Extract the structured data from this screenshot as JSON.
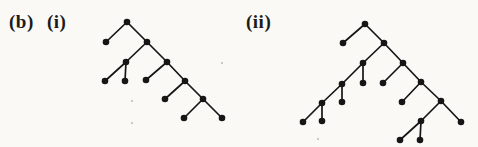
{
  "page": {
    "background": "#faf9f6",
    "width": 478,
    "height": 147
  },
  "labels": {
    "part": "(b)",
    "sub_i": "(i)",
    "sub_ii": "(ii)"
  },
  "style": {
    "ink": "#161616",
    "node_radius": 3.3,
    "edge_width": 1.7,
    "speck_color": "#a9a49b",
    "speck_radius": 1.1
  },
  "trees": [
    {
      "id": "tree-i",
      "label": "(i)",
      "nodes": [
        [
          127,
          22
        ],
        [
          106,
          42
        ],
        [
          147,
          42
        ],
        [
          126,
          62
        ],
        [
          167,
          62
        ],
        [
          105,
          81
        ],
        [
          125,
          81
        ],
        [
          146,
          80
        ],
        [
          185,
          81
        ],
        [
          165,
          99
        ],
        [
          203,
          99
        ],
        [
          184,
          118
        ],
        [
          222,
          118
        ]
      ],
      "edges": [
        [
          0,
          1
        ],
        [
          0,
          2
        ],
        [
          2,
          3
        ],
        [
          2,
          4
        ],
        [
          3,
          5
        ],
        [
          3,
          6
        ],
        [
          4,
          7
        ],
        [
          4,
          8
        ],
        [
          8,
          9
        ],
        [
          8,
          10
        ],
        [
          10,
          11
        ],
        [
          10,
          12
        ]
      ]
    },
    {
      "id": "tree-ii",
      "label": "(ii)",
      "nodes": [
        [
          365,
          24
        ],
        [
          343,
          43
        ],
        [
          384,
          43
        ],
        [
          363,
          63
        ],
        [
          403,
          63
        ],
        [
          342,
          84
        ],
        [
          363,
          83
        ],
        [
          383,
          83
        ],
        [
          421,
          82
        ],
        [
          322,
          103
        ],
        [
          342,
          102
        ],
        [
          402,
          102
        ],
        [
          441,
          101
        ],
        [
          303,
          122
        ],
        [
          322,
          121
        ],
        [
          421,
          121
        ],
        [
          461,
          122
        ],
        [
          400,
          140
        ],
        [
          420,
          140
        ]
      ],
      "edges": [
        [
          0,
          1
        ],
        [
          0,
          2
        ],
        [
          2,
          3
        ],
        [
          2,
          4
        ],
        [
          3,
          5
        ],
        [
          3,
          6
        ],
        [
          4,
          7
        ],
        [
          4,
          8
        ],
        [
          5,
          9
        ],
        [
          5,
          10
        ],
        [
          8,
          11
        ],
        [
          8,
          12
        ],
        [
          9,
          13
        ],
        [
          9,
          14
        ],
        [
          12,
          15
        ],
        [
          12,
          16
        ],
        [
          15,
          17
        ],
        [
          15,
          18
        ]
      ]
    }
  ],
  "specks": [
    [
      132,
      101
    ],
    [
      132,
      123
    ],
    [
      222,
      63
    ],
    [
      318,
      139
    ]
  ]
}
